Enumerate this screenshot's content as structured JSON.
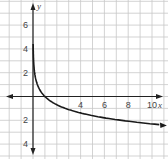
{
  "chart_data": {
    "type": "line",
    "title": "",
    "xlabel": "x",
    "ylabel": "y",
    "xlim": [
      -5.5,
      11
    ],
    "ylim": [
      -5.2,
      8
    ],
    "grid": true,
    "x_ticks": [
      4,
      6,
      8,
      10
    ],
    "y_ticks": [
      6,
      4,
      2,
      -2,
      -4
    ],
    "x_tick_labels": [
      "4",
      "6",
      "8",
      "10"
    ],
    "y_tick_labels": [
      "6",
      "4",
      "2",
      "2",
      "4"
    ],
    "series": [
      {
        "name": "curve",
        "description": "decreasing logarithmic curve with vertical asymptote at x=0",
        "x": [
          0.05,
          0.1,
          0.2,
          0.3,
          0.5,
          0.75,
          1,
          1.5,
          2,
          3,
          4,
          5,
          6,
          7,
          8,
          9,
          10,
          11
        ],
        "y": [
          2.9,
          2.3,
          1.6,
          1.2,
          0.69,
          0.29,
          0,
          -0.41,
          -0.69,
          -1.1,
          -1.39,
          -1.61,
          -1.79,
          -1.95,
          -2.08,
          -2.2,
          -2.3,
          -2.4
        ]
      }
    ],
    "colors": {
      "grid": "#c8c8c8",
      "axis": "#222222",
      "curve": "#1a1a1a"
    }
  }
}
